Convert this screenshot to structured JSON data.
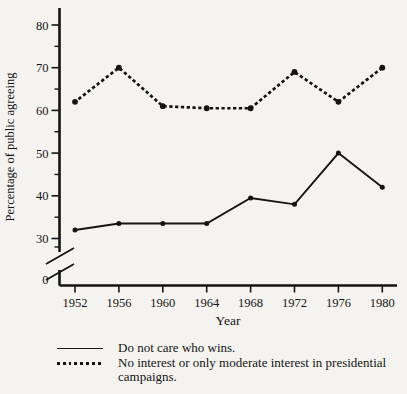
{
  "colors": {
    "ink": "#141414",
    "background": "#f4f3ef"
  },
  "chart_data": {
    "type": "line",
    "title": "",
    "xlabel": "Year",
    "ylabel": "Percentage of public agreeing",
    "categories": [
      "1952",
      "1956",
      "1960",
      "1964",
      "1968",
      "1972",
      "1976",
      "1980"
    ],
    "series": [
      {
        "name": "Do not care who wins.",
        "line_style": "solid",
        "values": [
          32,
          33.5,
          33.5,
          33.5,
          39.5,
          38,
          50,
          42
        ]
      },
      {
        "name": "No interest or only moderate interest in presidential campaigns.",
        "line_style": "dotted",
        "values": [
          62,
          70,
          61,
          60.5,
          60.5,
          69,
          62,
          70
        ]
      }
    ],
    "y_major_ticks": [
      80,
      70,
      60,
      50,
      40,
      30
    ],
    "y_minor_ticks": [
      75,
      65,
      55,
      45,
      35
    ],
    "y_zero_label": "0",
    "axis_break_between": [
      0,
      30
    ],
    "ylim_visible": [
      30,
      85
    ],
    "grid": false,
    "legend_position": "bottom-left"
  }
}
